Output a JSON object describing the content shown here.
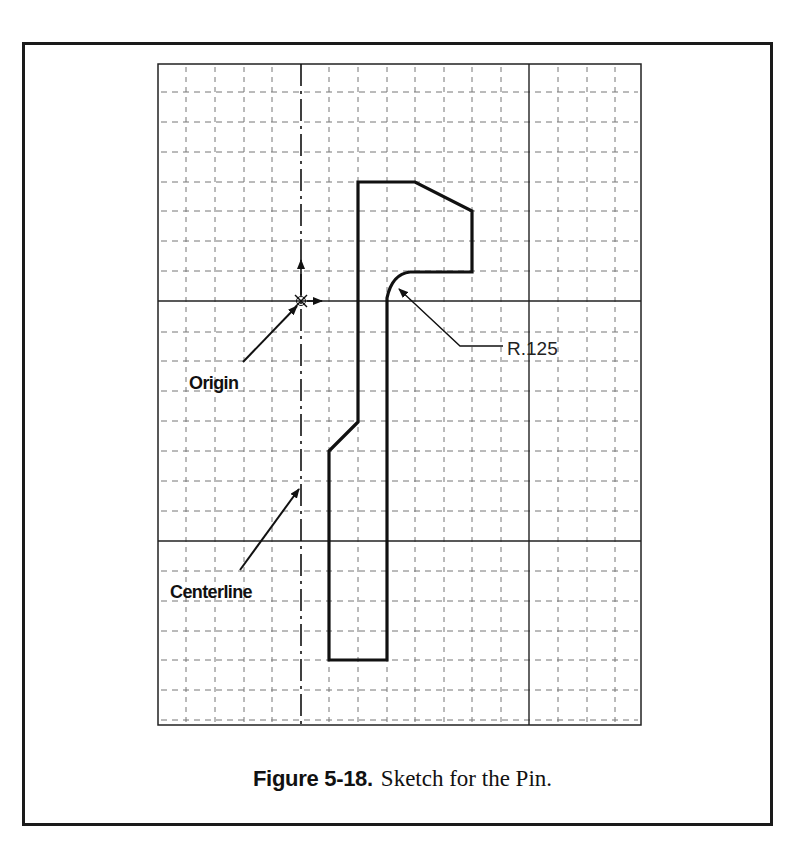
{
  "caption": {
    "figure_number": "Figure 5-18.",
    "text": "Sketch for the Pin."
  },
  "grid": {
    "left": 158,
    "top": 64,
    "right": 641,
    "bottom": 725,
    "vertical_lines": [
      186,
      215,
      244,
      272,
      329,
      358,
      387,
      415,
      444,
      472,
      501,
      558,
      587,
      615
    ],
    "horizontal_lines": [
      92,
      122,
      152,
      182,
      211,
      241,
      271,
      332,
      361,
      391,
      421,
      451,
      481,
      511,
      571,
      601,
      631,
      660,
      690,
      720
    ],
    "major_vertical": [
      529
    ],
    "major_horizontal": [
      301,
      541
    ],
    "centerline_x": 301
  },
  "origin": {
    "x": 301,
    "y": 301
  },
  "profile": {
    "path": "M358,182 L415,182 L472,211 L472,272 L410,272 Q392,274 387,298 L387,660 L329,660 L329,451 L358,422 Z"
  },
  "annotations": {
    "origin_label": "Origin",
    "centerline_label": "Centerline",
    "fillet_dimension": "R.125"
  },
  "colors": {
    "grid": "#777777",
    "major_line": "#222222",
    "profile": "#111111",
    "frame": "#1a1a1a"
  }
}
